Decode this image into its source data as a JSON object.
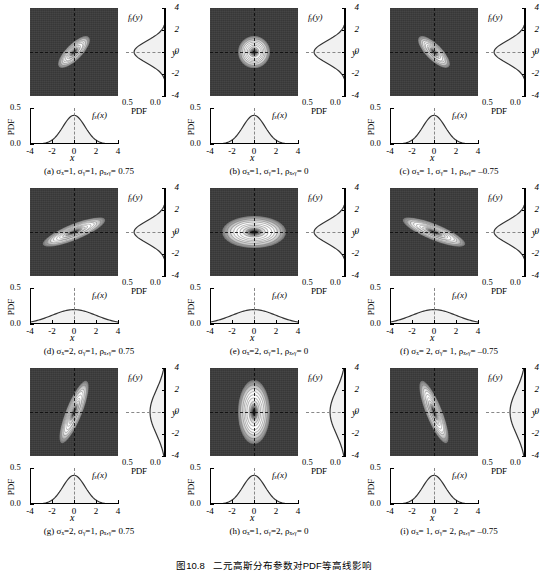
{
  "figure": {
    "number": "图10.8",
    "title": "二元高斯分布参数对PDF等高线影响"
  },
  "axis_labels": {
    "f_y": "fᵧ(y)",
    "f_x": "fₓ(x)",
    "y": "y",
    "x": "x",
    "pdf": "PDF"
  },
  "ticks": {
    "y_axis": [
      "4",
      "2",
      "0",
      "-2",
      "-4"
    ],
    "x_axis": [
      "-4",
      "-2",
      "0",
      "2",
      "4"
    ],
    "pdf_vertical": [
      "0.5",
      "0.0"
    ],
    "pdf_horizontal": [
      "0.5",
      "0.0"
    ]
  },
  "chart_data": {
    "type": "heatmap",
    "title": "二元高斯分布参数对PDF等高线影响",
    "xlabel": "x",
    "ylabel": "y",
    "xlim": [
      -4,
      4
    ],
    "ylim": [
      -4,
      4
    ],
    "pdf_lim": [
      0.0,
      0.5
    ],
    "grid": true,
    "legend": "none",
    "panels": [
      {
        "id": "a",
        "caption": "(a) σₓ=1, σᵧ=1, ρₓ,ᵧ= 0.75",
        "sigma_x": 1,
        "sigma_y": 1,
        "rho": 0.75,
        "orientation_deg": -45,
        "ellipse_major": 1.32,
        "ellipse_minor": 0.5,
        "marginal_x_peak": 0.4,
        "marginal_y_peak": 0.4
      },
      {
        "id": "b",
        "caption": "(b) σₓ=1, σᵧ=1, ρₓ,ᵧ= 0",
        "sigma_x": 1,
        "sigma_y": 1,
        "rho": 0,
        "orientation_deg": 0,
        "ellipse_major": 1.0,
        "ellipse_minor": 1.0,
        "marginal_x_peak": 0.4,
        "marginal_y_peak": 0.4
      },
      {
        "id": "c",
        "caption": "(c) σₓ= 1, σᵧ= 1, ρₓ,ᵧ= –0.75",
        "sigma_x": 1,
        "sigma_y": 1,
        "rho": -0.75,
        "orientation_deg": 45,
        "ellipse_major": 1.32,
        "ellipse_minor": 0.5,
        "marginal_x_peak": 0.4,
        "marginal_y_peak": 0.4
      },
      {
        "id": "d",
        "caption": "(d) σₓ=2, σᵧ=1, ρₓ,ᵧ= 0.75",
        "sigma_x": 2,
        "sigma_y": 1,
        "rho": 0.75,
        "orientation_deg": -22,
        "ellipse_major": 2.1,
        "ellipse_minor": 0.5,
        "marginal_x_peak": 0.2,
        "marginal_y_peak": 0.4
      },
      {
        "id": "e",
        "caption": "(e) σₓ=2, σᵧ=1, ρₓ,ᵧ= 0",
        "sigma_x": 2,
        "sigma_y": 1,
        "rho": 0,
        "orientation_deg": 0,
        "ellipse_major": 2.0,
        "ellipse_minor": 1.0,
        "marginal_x_peak": 0.2,
        "marginal_y_peak": 0.4
      },
      {
        "id": "f",
        "caption": "(f) σₓ= 2, σᵧ= 1, ρₓ,ᵧ= –0.75",
        "sigma_x": 2,
        "sigma_y": 1,
        "rho": -0.75,
        "orientation_deg": 22,
        "ellipse_major": 2.1,
        "ellipse_minor": 0.5,
        "marginal_x_peak": 0.2,
        "marginal_y_peak": 0.4
      },
      {
        "id": "g",
        "caption": "(g) σₓ=2, σᵧ=1, ρₓ,ᵧ= 0.75",
        "sigma_x": 1,
        "sigma_y": 2,
        "rho": 0.75,
        "orientation_deg": -68,
        "ellipse_major": 2.1,
        "ellipse_minor": 0.5,
        "marginal_x_peak": 0.4,
        "marginal_y_peak": 0.2
      },
      {
        "id": "h",
        "caption": "(h) σₓ=1, σᵧ=2, ρₓ,ᵧ= 0",
        "sigma_x": 1,
        "sigma_y": 2,
        "rho": 0,
        "orientation_deg": 90,
        "ellipse_major": 2.0,
        "ellipse_minor": 1.0,
        "marginal_x_peak": 0.4,
        "marginal_y_peak": 0.2
      },
      {
        "id": "i",
        "caption": "(i) σₓ= 1, σᵧ= 2, ρₓ,ᵧ= –0.75",
        "sigma_x": 1,
        "sigma_y": 2,
        "rho": -0.75,
        "orientation_deg": 68,
        "ellipse_major": 2.1,
        "ellipse_minor": 0.5,
        "marginal_x_peak": 0.4,
        "marginal_y_peak": 0.2
      }
    ]
  },
  "colors": {
    "background": "#ffffff",
    "heatmap_low": "#3a3a3a",
    "heatmap_high": "#ffffff",
    "curve": "#333333",
    "fill": "#f0f0f0",
    "axis": "#000000"
  }
}
